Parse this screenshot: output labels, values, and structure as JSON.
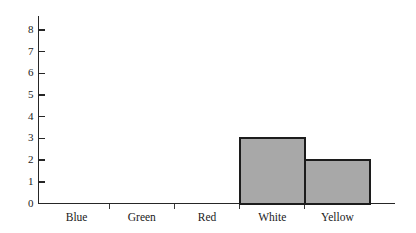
{
  "chart_data": {
    "type": "bar",
    "title": "",
    "subtitle": "",
    "xlabel": "",
    "ylabel": "",
    "categories": [
      "Blue",
      "Green",
      "Red",
      "White",
      "Yellow"
    ],
    "values": [
      0,
      0,
      0,
      3,
      2
    ],
    "ylim": [
      0,
      8
    ],
    "y_ticks": [
      0,
      1,
      2,
      3,
      4,
      5,
      6,
      7,
      8
    ],
    "y_tick_labels": [
      "0",
      "1",
      "2",
      "3",
      "4",
      "5",
      "6",
      "7",
      "8"
    ],
    "x_tick_labels": [
      "Blue",
      "Green",
      "Red",
      "White",
      "Yellow"
    ],
    "grid": false,
    "legend": null,
    "legend_position": "none",
    "annotations": [],
    "bar_style": "adjacent",
    "colors": {
      "bar_fill": "#a8a8a8",
      "bar_edge": "#1c1c1c",
      "axis": "#262626",
      "text": "#1a1a1a",
      "background": "#ffffff"
    }
  }
}
